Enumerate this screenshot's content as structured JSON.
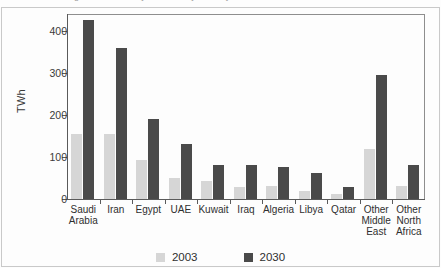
{
  "page": {
    "caption_remnant": "Figure 1  Electricity demand by country"
  },
  "chart_data": {
    "type": "bar",
    "title": "",
    "xlabel": "",
    "ylabel": "TWh",
    "ylim": [
      0,
      440
    ],
    "yticks": [
      0,
      100,
      200,
      300,
      400
    ],
    "ytick_labels": [
      "0",
      "100",
      "200",
      "300",
      "400"
    ],
    "grid": false,
    "legend_position": "bottom",
    "categories": [
      "Saudi Arabia",
      "Iran",
      "Egypt",
      "UAE",
      "Kuwait",
      "Iraq",
      "Algeria",
      "Libya",
      "Qatar",
      "Other Middle East",
      "Other North Africa"
    ],
    "category_lines": [
      [
        "Saudi",
        "Arabia"
      ],
      [
        "Iran"
      ],
      [
        "Egypt"
      ],
      [
        "UAE"
      ],
      [
        "Kuwait"
      ],
      [
        "Iraq"
      ],
      [
        "Algeria"
      ],
      [
        "Libya"
      ],
      [
        "Qatar"
      ],
      [
        "Other",
        "Middle",
        "East"
      ],
      [
        "Other",
        "North",
        "Africa"
      ]
    ],
    "series": [
      {
        "name": "2003",
        "color": "#d6d6d6",
        "values": [
          155,
          155,
          93,
          50,
          42,
          28,
          31,
          20,
          13,
          118,
          31
        ]
      },
      {
        "name": "2030",
        "color": "#4a4a4a",
        "values": [
          425,
          358,
          190,
          131,
          82,
          82,
          77,
          62,
          28,
          294,
          82
        ]
      }
    ]
  },
  "legend": {
    "items": [
      {
        "label": "2003",
        "color": "#d6d6d6"
      },
      {
        "label": "2030",
        "color": "#4a4a4a"
      }
    ]
  }
}
